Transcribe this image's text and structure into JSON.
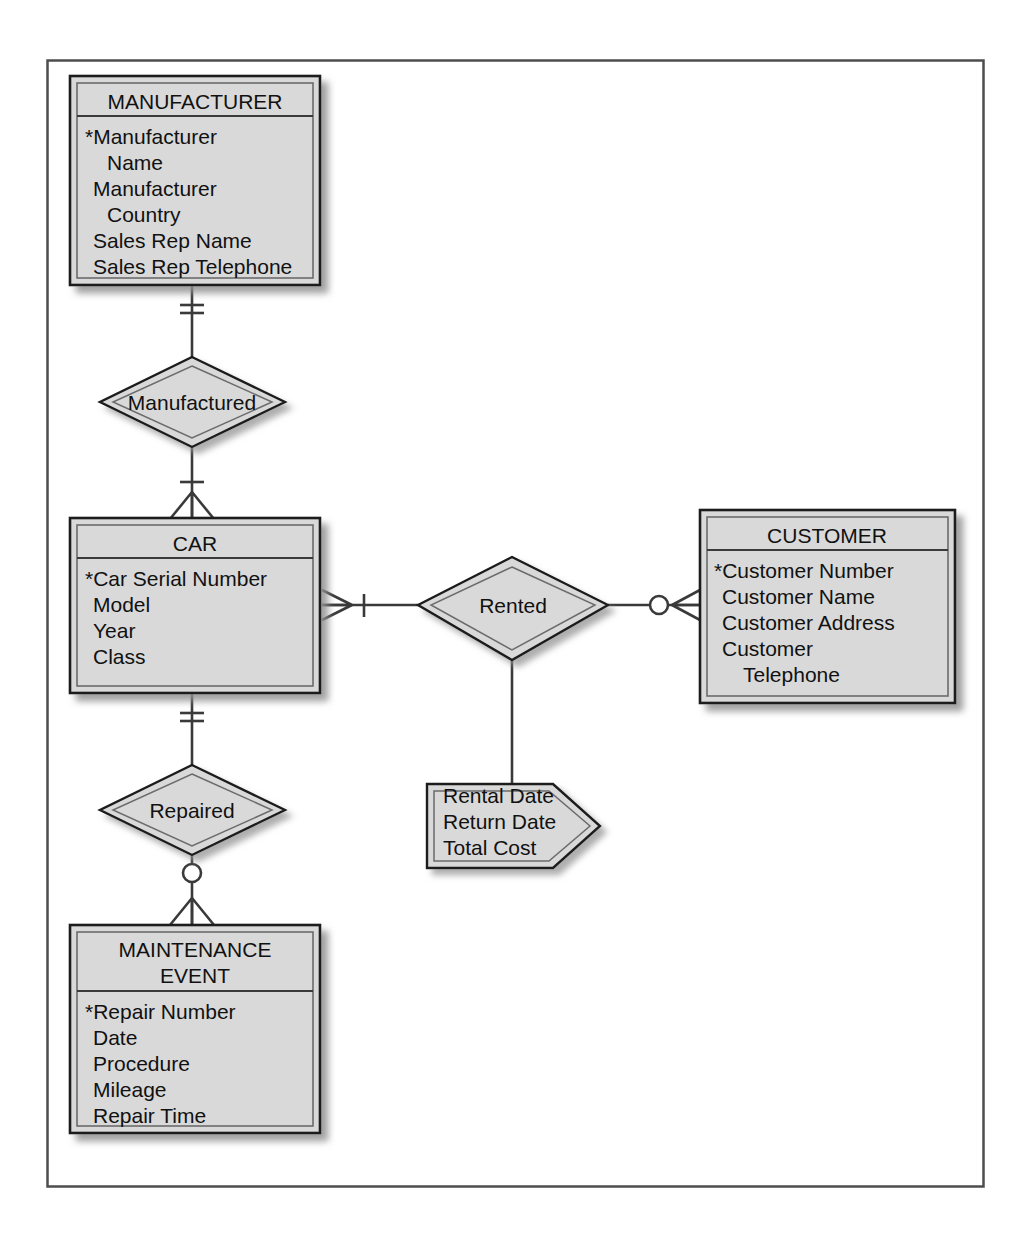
{
  "diagram": {
    "notation": "Crow's Foot / Information Engineering",
    "key_symbol": "*",
    "colors": {
      "entity_fill": "#d9d9d9",
      "entity_header_fill": "#d9d9d9",
      "relationship_fill": "#d9d9d9",
      "attribute_fill": "#d9d9d9",
      "stroke": "#1a1a1a",
      "inner_stroke": "#555555",
      "frame_stroke": "#555555",
      "shadow": "#9a9a9a",
      "background": "#ffffff",
      "text": "#111111"
    },
    "frame": {
      "label": "diagram-frame"
    }
  },
  "entities": [
    {
      "id": "manufacturer",
      "name": "MANUFACTURER",
      "attributes": [
        {
          "text": "*Manufacturer",
          "key": true,
          "indent": false
        },
        {
          "text": "Name",
          "key": false,
          "indent": true
        },
        {
          "text": "Manufacturer",
          "key": false,
          "indent": false
        },
        {
          "text": "Country",
          "key": false,
          "indent": true
        },
        {
          "text": "Sales Rep Name",
          "key": false,
          "indent": false
        },
        {
          "text": "Sales Rep Telephone",
          "key": false,
          "indent": false
        }
      ]
    },
    {
      "id": "car",
      "name": "CAR",
      "attributes": [
        {
          "text": "*Car Serial Number",
          "key": true,
          "indent": false
        },
        {
          "text": "Model",
          "key": false,
          "indent": false
        },
        {
          "text": "Year",
          "key": false,
          "indent": false
        },
        {
          "text": "Class",
          "key": false,
          "indent": false
        }
      ]
    },
    {
      "id": "customer",
      "name": "CUSTOMER",
      "attributes": [
        {
          "text": "*Customer Number",
          "key": true,
          "indent": false
        },
        {
          "text": "Customer Name",
          "key": false,
          "indent": false
        },
        {
          "text": "Customer Address",
          "key": false,
          "indent": false
        },
        {
          "text": "Customer",
          "key": false,
          "indent": false
        },
        {
          "text": "Telephone",
          "key": false,
          "indent": true
        }
      ]
    },
    {
      "id": "maintenance-event",
      "name_line1": "MAINTENANCE",
      "name_line2": "EVENT",
      "name": "MAINTENANCE EVENT",
      "attributes": [
        {
          "text": "*Repair Number",
          "key": true,
          "indent": false
        },
        {
          "text": "Date",
          "key": false,
          "indent": false
        },
        {
          "text": "Procedure",
          "key": false,
          "indent": false
        },
        {
          "text": "Mileage",
          "key": false,
          "indent": false
        },
        {
          "text": "Repair Time",
          "key": false,
          "indent": false
        }
      ]
    }
  ],
  "relationships": [
    {
      "id": "manufactured",
      "label": "Manufactured",
      "from": "MANUFACTURER",
      "to": "CAR",
      "from_cardinality": "one-and-only-one",
      "to_cardinality": "one-or-many"
    },
    {
      "id": "rented",
      "label": "Rented",
      "from": "CAR",
      "to": "CUSTOMER",
      "from_cardinality": "one-or-many",
      "to_cardinality": "zero-or-many"
    },
    {
      "id": "repaired",
      "label": "Repaired",
      "from": "CAR",
      "to": "MAINTENANCE EVENT",
      "from_cardinality": "one-and-only-one",
      "to_cardinality": "zero-or-many"
    }
  ],
  "relationship_attributes": [
    {
      "id": "rented-attributes",
      "belongs_to": "Rented",
      "lines": [
        "Rental Date",
        "Return Date",
        "Total Cost"
      ]
    }
  ]
}
